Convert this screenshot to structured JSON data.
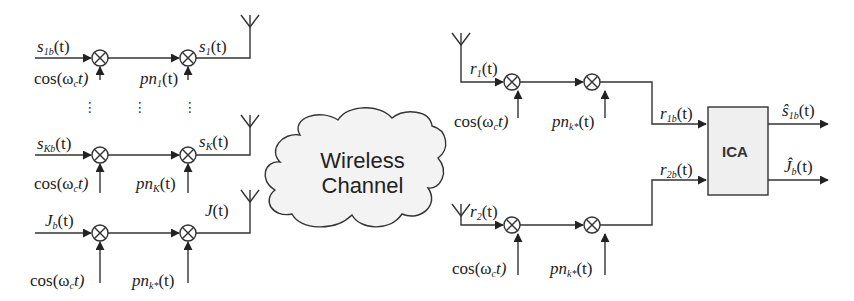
{
  "diagram": {
    "type": "block-diagram",
    "transmitter": {
      "rows": [
        {
          "input": "s",
          "input_sub": "1b",
          "output": "s",
          "output_sub": "1",
          "carrier": "cos(ω",
          "carrier_sub": "c",
          "code": "pn",
          "code_sub": "1"
        },
        {
          "input": "s",
          "input_sub": "Kb",
          "output": "s",
          "output_sub": "K",
          "carrier": "cos(ω",
          "carrier_sub": "c",
          "code": "pn",
          "code_sub": "K"
        },
        {
          "input": "J",
          "input_sub": "b",
          "output": "J",
          "output_sub": "",
          "carrier": "cos(ω",
          "carrier_sub": "c",
          "code": "pn",
          "code_sub": "k*"
        }
      ],
      "ellipsis": "⋮"
    },
    "channel": {
      "line1": "Wireless",
      "line2": "Channel"
    },
    "receiver": {
      "rows": [
        {
          "input": "r",
          "input_sub": "1",
          "output": "r",
          "output_sub": "1b",
          "carrier": "cos(ω",
          "carrier_sub": "c",
          "code": "pn",
          "code_sub": "k*"
        },
        {
          "input": "r",
          "input_sub": "2",
          "output": "r",
          "output_sub": "2b",
          "carrier": "cos(ω",
          "carrier_sub": "c",
          "code": "pn",
          "code_sub": "k*"
        }
      ],
      "block": "ICA",
      "outputs": [
        {
          "symbol": "ŝ",
          "sub": "1b"
        },
        {
          "symbol": "Ĵ",
          "sub": "b"
        }
      ]
    },
    "time_arg": "(t)",
    "close_t": "t)",
    "colors": {
      "line": "#333333",
      "cloud_fill": "#f3f3f3",
      "ica_fill": "#efefef"
    }
  }
}
